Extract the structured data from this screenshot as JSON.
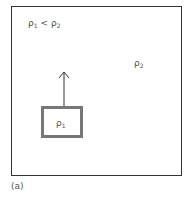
{
  "diagram": {
    "relation_label": {
      "base": "ρ",
      "sub1": "1",
      "op": "<",
      "sub2": "2"
    },
    "medium_label": {
      "base": "ρ",
      "sub": "2"
    },
    "object_label": {
      "base": "ρ",
      "sub": "1"
    },
    "caption": "(a)",
    "colors": {
      "frame": "#333333",
      "object_border": "#777777",
      "arrow": "#333333"
    }
  }
}
